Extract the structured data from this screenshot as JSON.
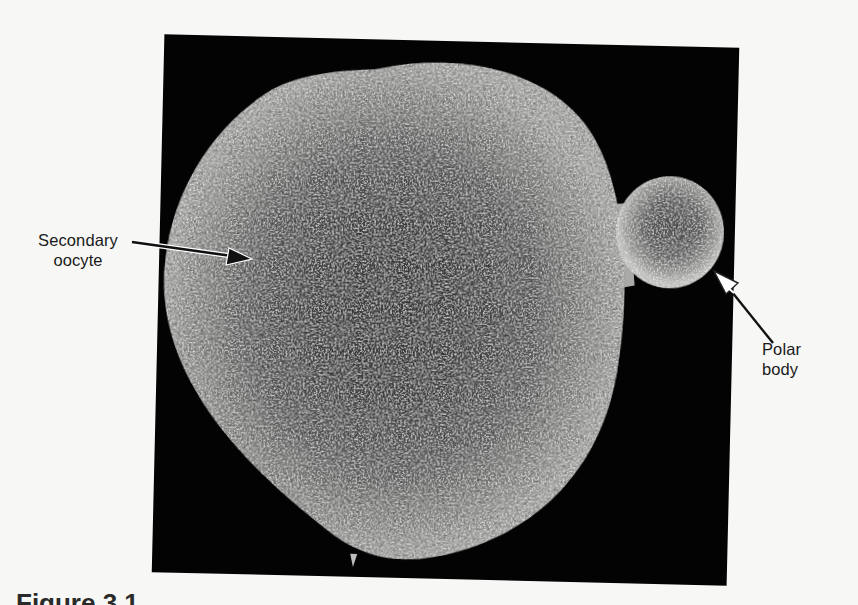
{
  "figure": {
    "caption_visible": "Figure 3.1",
    "background_color": "#f7f7f5",
    "panel_color": "#030303"
  },
  "micrograph": {
    "subject": "scanning electron micrograph of secondary oocyte with polar body",
    "oocyte_color_edge": "#9a9a98",
    "oocyte_color_center": "#3a3a3a",
    "polar_body_color_edge": "#b8b8b6",
    "polar_body_color_center": "#4a4a4a"
  },
  "labels": {
    "oocyte": {
      "line1": "Secondary",
      "line2": "oocyte",
      "arrow_style": "solid-black"
    },
    "polar_body": {
      "line1": "Polar",
      "line2": "body",
      "arrow_style": "hollow-white"
    }
  }
}
